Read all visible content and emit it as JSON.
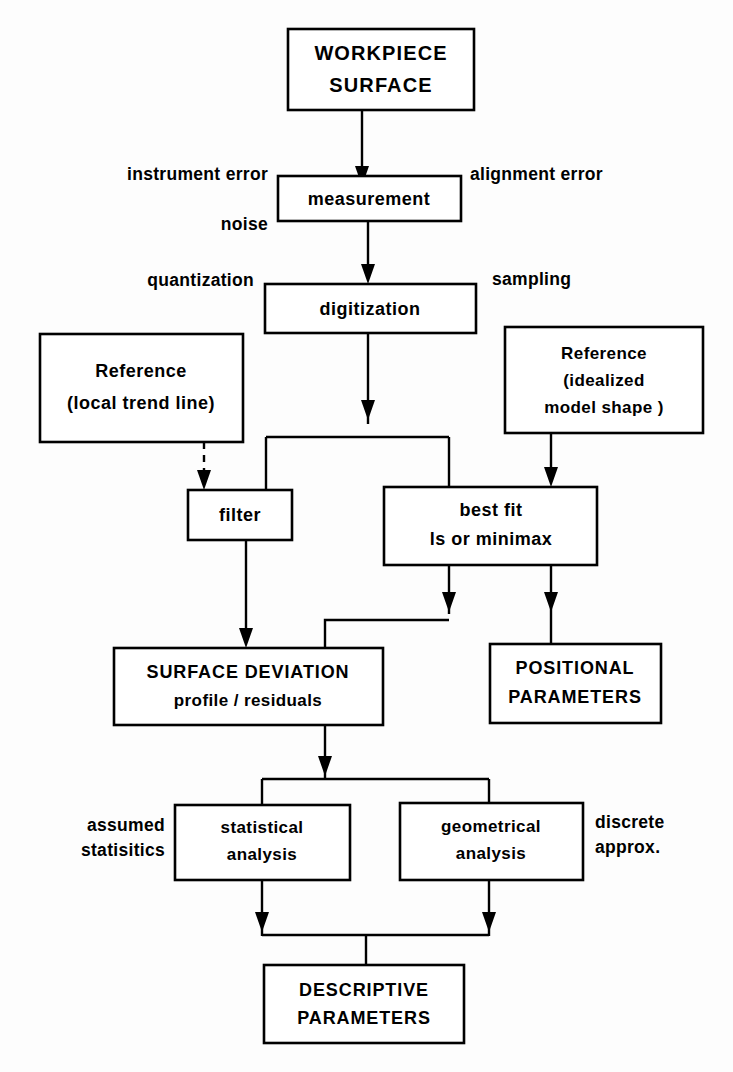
{
  "diagram": {
    "line_color": "#000000",
    "box_fill": "#ffffff",
    "background": "#ffffff"
  },
  "nodes": {
    "workpiece": {
      "line1": "WORKPIECE",
      "line2": "SURFACE"
    },
    "measurement": {
      "line1": "measurement"
    },
    "digitization": {
      "line1": "digitization"
    },
    "reference_local": {
      "line1": "Reference",
      "line2": "(local trend line)"
    },
    "reference_model": {
      "line1": "Reference",
      "line2": "(idealized",
      "line3": "model shape )"
    },
    "filter": {
      "line1": "filter"
    },
    "bestfit": {
      "line1": "best fit",
      "line2": "ls or minimax"
    },
    "surface_deviation": {
      "line1": "SURFACE DEVIATION",
      "line2": "profile / residuals"
    },
    "positional_parameters": {
      "line1": "POSITIONAL",
      "line2": "PARAMETERS"
    },
    "statistical_analysis": {
      "line1": "statistical",
      "line2": "analysis"
    },
    "geometrical_analysis": {
      "line1": "geometrical",
      "line2": "analysis"
    },
    "descriptive_parameters": {
      "line1": "DESCRIPTIVE",
      "line2": "PARAMETERS"
    }
  },
  "annotations": {
    "instrument_error": "instrument error",
    "alignment_error": "alignment error",
    "noise": "noise",
    "quantization": "quantization",
    "sampling": "sampling",
    "assumed": "assumed",
    "statisitics": "statisitics",
    "discrete": "discrete",
    "approx": "approx."
  }
}
